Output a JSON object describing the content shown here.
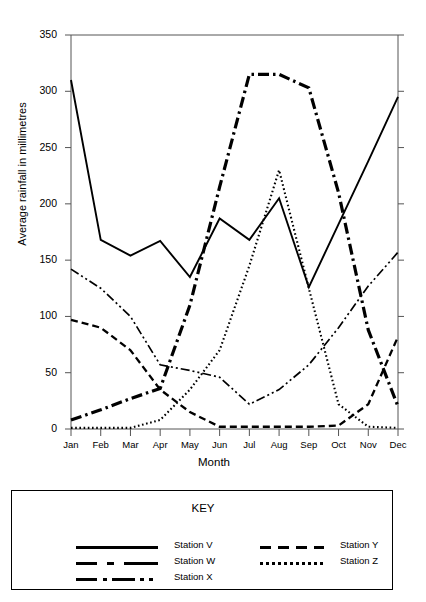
{
  "chart_data": {
    "type": "line",
    "title": "",
    "xlabel": "Month",
    "ylabel": "Average rainfall in millimetres",
    "categories": [
      "Jan",
      "Feb",
      "Mar",
      "Apr",
      "May",
      "Jun",
      "Jul",
      "Aug",
      "Sep",
      "Oct",
      "Nov",
      "Dec"
    ],
    "ylim": [
      0,
      350
    ],
    "yticks": [
      0,
      50,
      100,
      150,
      200,
      250,
      300,
      350
    ],
    "grid": false,
    "legend_position": "below-plot-in-key-box",
    "series": [
      {
        "name": "Station V",
        "style": "solid",
        "values": [
          310,
          168,
          154,
          167,
          135,
          187,
          168,
          205,
          126,
          182,
          238,
          295
        ]
      },
      {
        "name": "Station W",
        "style": "dash-dot-thick",
        "values": [
          8,
          17,
          27,
          36,
          110,
          215,
          315,
          315,
          303,
          210,
          88,
          20
        ]
      },
      {
        "name": "Station X",
        "style": "dash-dot-dot",
        "values": [
          142,
          125,
          100,
          57,
          52,
          46,
          22,
          35,
          57,
          90,
          127,
          157
        ]
      },
      {
        "name": "Station Y",
        "style": "dashed",
        "values": [
          97,
          90,
          70,
          35,
          15,
          2,
          2,
          2,
          2,
          3,
          22,
          82
        ]
      },
      {
        "name": "Station Z",
        "style": "dotted",
        "values": [
          1,
          1,
          1,
          8,
          35,
          70,
          145,
          230,
          125,
          22,
          2,
          1
        ]
      }
    ]
  },
  "key": {
    "title": "KEY",
    "left_entries": [
      {
        "label": "Station V",
        "swatch": "sw-solid"
      },
      {
        "label": "Station W",
        "swatch": "sw-dashdot"
      },
      {
        "label": "Station X",
        "swatch": "sw-dashdotdot"
      }
    ],
    "right_entries": [
      {
        "label": "Station Y",
        "swatch": "sw-dashed"
      },
      {
        "label": "Station Z",
        "swatch": "sw-dotted"
      }
    ]
  },
  "colors": {
    "ink": "#000000",
    "axis": "#555555",
    "background": "#ffffff"
  }
}
